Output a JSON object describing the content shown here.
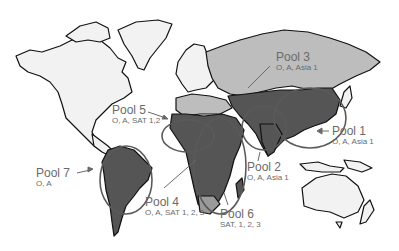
{
  "map": {
    "type": "world-map",
    "legend_style": "callout labels",
    "colors": {
      "background": "#ffffff",
      "unassigned_land": "#f0f0f0",
      "pool3_region": "#bdbdbd",
      "endemic_dark": "#555555",
      "intermediate": "#9a9a9a",
      "outline": "#111111",
      "label_text": "#6a6a6a",
      "pool_ellipse": "#5a5a5a"
    },
    "pools": [
      {
        "id": "pool1",
        "name": "Pool 1",
        "serotypes": "O, A, Asia 1",
        "region": "East Asia"
      },
      {
        "id": "pool2",
        "name": "Pool 2",
        "serotypes": "O, A, Asia 1",
        "region": "South Asia"
      },
      {
        "id": "pool3",
        "name": "Pool 3",
        "serotypes": "O, A, Asia 1",
        "region": "Eurasia / Middle East"
      },
      {
        "id": "pool4",
        "name": "Pool 4",
        "serotypes": "O, A, SAT 1, 2, 3",
        "region": "East Africa"
      },
      {
        "id": "pool5",
        "name": "Pool 5",
        "serotypes": "O, A, SAT 1,2",
        "region": "West Africa"
      },
      {
        "id": "pool6",
        "name": "Pool 6",
        "serotypes": "SAT, 1, 2, 3",
        "region": "Southern Africa"
      },
      {
        "id": "pool7",
        "name": "Pool 7",
        "serotypes": "O, A",
        "region": "South America"
      }
    ]
  }
}
